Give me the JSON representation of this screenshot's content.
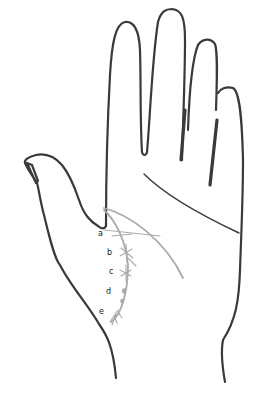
{
  "figure": {
    "colors": {
      "outline": "#3a3a3a",
      "life_line": "#aaaaaa",
      "background": "#ffffff",
      "label": "#222222"
    },
    "labels": [
      {
        "id": "a",
        "text": "a"
      },
      {
        "id": "b",
        "text": "b"
      },
      {
        "id": "c",
        "text": "c"
      },
      {
        "id": "d",
        "text": "d"
      },
      {
        "id": "e",
        "text": "e"
      }
    ]
  }
}
